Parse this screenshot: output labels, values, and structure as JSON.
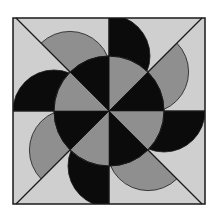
{
  "figure": {
    "title": "Pinwheel quilt block",
    "colors": {
      "page": "#ffffff",
      "background": "#cfcfcf",
      "gray": "#8f8f8f",
      "black": "#0b0b0b",
      "line": "#1a1a1a"
    },
    "rays": 8,
    "petals": [
      {
        "direction": "top",
        "color": "black"
      },
      {
        "direction": "top-right",
        "color": "gray"
      },
      {
        "direction": "right",
        "color": "black"
      },
      {
        "direction": "bottom-right",
        "color": "gray"
      },
      {
        "direction": "bottom",
        "color": "black"
      },
      {
        "direction": "bottom-left",
        "color": "gray"
      },
      {
        "direction": "left",
        "color": "black"
      },
      {
        "direction": "top-left",
        "color": "gray"
      }
    ],
    "center_wedges": [
      {
        "between": "top / top-right",
        "color": "gray"
      },
      {
        "between": "top-right / right",
        "color": "black"
      },
      {
        "between": "right / bottom-right",
        "color": "gray"
      },
      {
        "between": "bottom-right / bottom",
        "color": "black"
      },
      {
        "between": "bottom / bottom-left",
        "color": "gray"
      },
      {
        "between": "bottom-left / left",
        "color": "black"
      },
      {
        "between": "left / top-left",
        "color": "gray"
      },
      {
        "between": "top-left / top",
        "color": "black"
      }
    ]
  }
}
